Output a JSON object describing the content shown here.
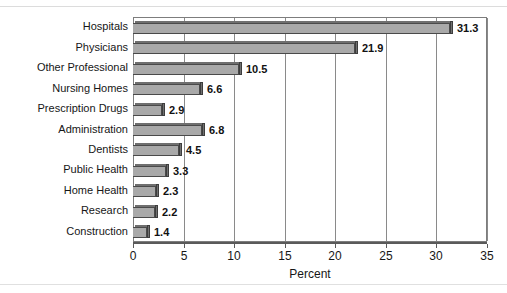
{
  "chart_data": {
    "type": "bar",
    "orientation": "horizontal",
    "title": "",
    "xlabel": "Percent",
    "ylabel": "",
    "xlim": [
      0,
      35
    ],
    "xticks": [
      0,
      5,
      10,
      15,
      20,
      25,
      30,
      35
    ],
    "xtick_labels": [
      "0",
      "5",
      "10",
      "15",
      "20",
      "25",
      "30",
      "35"
    ],
    "grid": true,
    "legend": "none",
    "categories": [
      "Hospitals",
      "Physicians",
      "Other Professional",
      "Nursing Homes",
      "Prescription Drugs",
      "Administration",
      "Dentists",
      "Public Health",
      "Home Health",
      "Research",
      "Construction"
    ],
    "values": [
      31.3,
      21.9,
      10.5,
      6.6,
      2.9,
      6.8,
      4.5,
      3.3,
      2.3,
      2.2,
      1.4
    ],
    "value_labels": [
      "31.3",
      "21.9",
      "10.5",
      "6.6",
      "2.9",
      "6.8",
      "4.5",
      "3.3",
      "2.3",
      "2.2",
      "1.4"
    ],
    "bar_color": "#a9a9a9",
    "bar_edge_color": "#4a4a4a",
    "bar_shadow_color": "#707070",
    "grid_color": "#8a8a8a",
    "frame_color": "#7d7d7d"
  },
  "artifacts": {
    "clipped_caption": "",
    "top_rule_color": "#dcdcdc",
    "bottom_rule_color": "#e0e0e0"
  }
}
